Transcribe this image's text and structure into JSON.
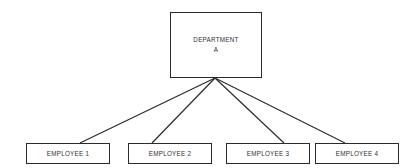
{
  "diagram": {
    "type": "organizational-hierarchy",
    "background_color": "#ffffff",
    "line_color": "#2b2b2b",
    "text_color": "#2f2f2f",
    "root": {
      "name": "department-a",
      "line1": "DEPARTMENT",
      "line2": "A"
    },
    "children": [
      {
        "name": "employee-1",
        "label": "EMPLOYEE 1"
      },
      {
        "name": "employee-2",
        "label": "EMPLOYEE 2"
      },
      {
        "name": "employee-3",
        "label": "EMPLOYEE 3"
      },
      {
        "name": "employee-4",
        "label": "EMPLOYEE 4"
      }
    ],
    "connectors": {
      "origin": {
        "x": 215,
        "y": 78
      },
      "endpoints": [
        {
          "x": 80,
          "y": 143
        },
        {
          "x": 152,
          "y": 143
        },
        {
          "x": 284,
          "y": 143
        },
        {
          "x": 345,
          "y": 143
        }
      ]
    }
  }
}
